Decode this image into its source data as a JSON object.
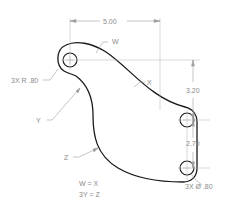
{
  "drawing": {
    "type": "engineering part drawing",
    "dimensions": {
      "horizontal": "5.00",
      "vertical_upper": "3.20",
      "vertical_lower": "2.70"
    },
    "callouts": {
      "radius": "3X R .80",
      "diameter": "3X Ø .80"
    },
    "curve_labels": {
      "w": "W",
      "x": "X",
      "y": "Y",
      "z": "Z"
    },
    "notes": {
      "line1": "W = X",
      "line2": "3Y = Z"
    },
    "colors": {
      "part_outline": "#1a1a1a",
      "dimension_lines": "#a0a0a0",
      "text": "#8a8a8a",
      "background": "#ffffff"
    }
  }
}
